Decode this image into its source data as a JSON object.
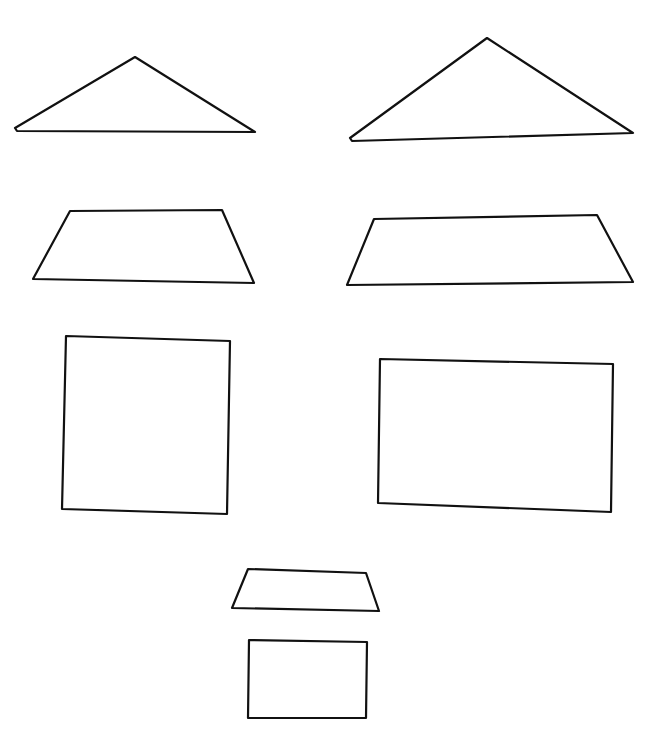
{
  "canvas": {
    "width": 660,
    "height": 731,
    "background": "#ffffff",
    "stroke": "#111111"
  },
  "shapes": [
    {
      "name": "triangle-small",
      "type": "triangle",
      "points": "15,128 135,57 255,132 17,131"
    },
    {
      "name": "triangle-large",
      "type": "triangle",
      "points": "350,138 487,38 633,133 352,141"
    },
    {
      "name": "trapezoid-left",
      "type": "trapezoid",
      "points": "70,211 222,210 254,283 33,279"
    },
    {
      "name": "trapezoid-right",
      "type": "trapezoid",
      "points": "374,219 597,215 633,282 347,285"
    },
    {
      "name": "rectangle-square",
      "type": "rectangle",
      "points": "66,336 230,341 227,514 62,509"
    },
    {
      "name": "rectangle-wide",
      "type": "rectangle",
      "points": "380,359 613,364 611,512 378,503"
    },
    {
      "name": "trapezoid-small",
      "type": "trapezoid",
      "points": "248,569 366,573 379,611 232,608"
    },
    {
      "name": "rectangle-small",
      "type": "rectangle",
      "points": "249,640 367,642 366,718 248,718"
    }
  ]
}
